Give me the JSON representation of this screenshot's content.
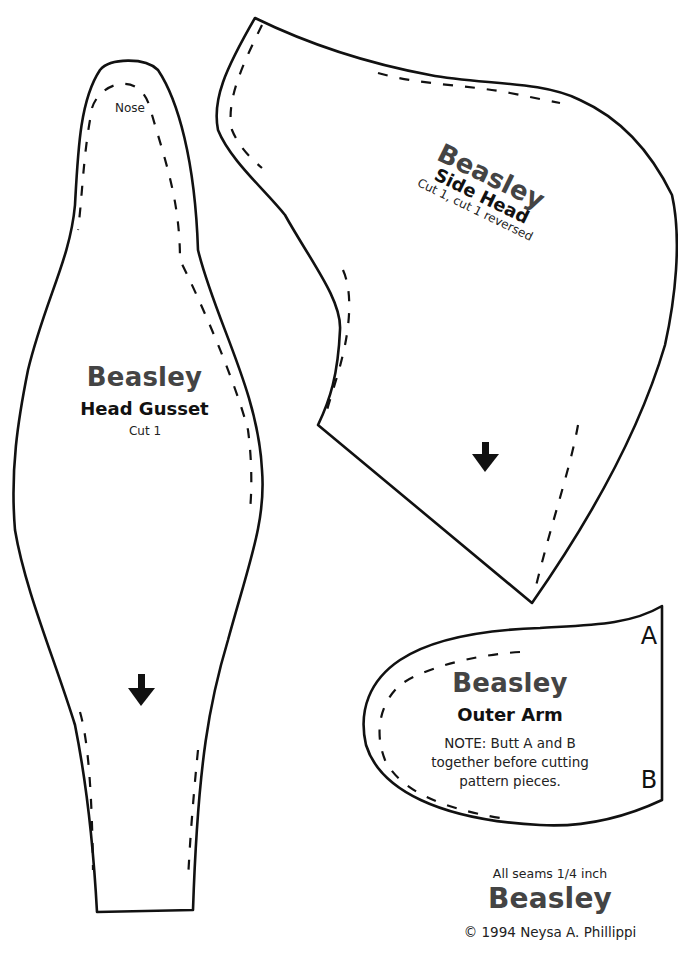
{
  "colors": {
    "outline": "#111111",
    "name_text": "#444444",
    "background": "#ffffff"
  },
  "head_gusset": {
    "nose_label": "Nose",
    "name": "Beasley",
    "title": "Head Gusset",
    "cut": "Cut 1",
    "grain_arrow": "down-arrow-icon"
  },
  "side_head": {
    "name": "Beasley",
    "title": "Side Head",
    "cut": "Cut 1, cut 1 reversed",
    "grain_arrow": "down-arrow-icon"
  },
  "outer_arm": {
    "name": "Beasley",
    "title": "Outer Arm",
    "note_line1": "NOTE: Butt A and B",
    "note_line2": "together before cutting",
    "note_line3": "pattern pieces.",
    "mark_a": "A",
    "mark_b": "B"
  },
  "footer": {
    "seams": "All seams 1/4 inch",
    "name": "Beasley",
    "copyright": "© 1994 Neysa A. Phillippi"
  }
}
